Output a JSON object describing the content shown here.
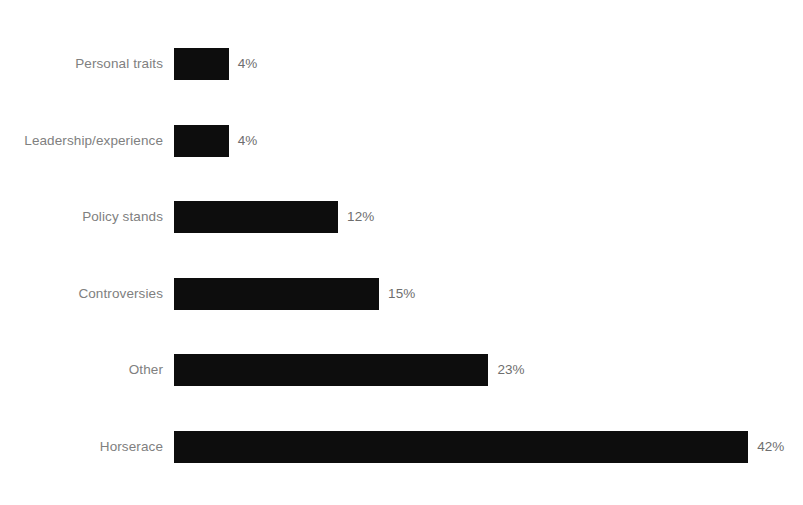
{
  "chart_data": {
    "type": "bar",
    "orientation": "horizontal",
    "title": "",
    "subtitle": "",
    "xlabel": "",
    "ylabel": "",
    "categories": [
      "Personal traits",
      "Leadership/experience",
      "Policy stands",
      "Controversies",
      "Other",
      "Horserace"
    ],
    "values": [
      4,
      4,
      12,
      15,
      23,
      42
    ],
    "value_labels": [
      "4%",
      "4%",
      "12%",
      "15%",
      "23%",
      "42%"
    ],
    "xlim": [
      0,
      42
    ],
    "grid": false,
    "legend": null,
    "bar_color": "#0d0d0d",
    "label_color": "#808080",
    "background_color": "#ffffff",
    "axis_ticks": [],
    "annotations": []
  },
  "layout": {
    "bar_origin_x_px": 174,
    "px_per_percent": 13.67,
    "bar_height_px": 32,
    "row_pitch_px": 76.5,
    "first_row_top_px": 48,
    "label_gap_px": 9
  }
}
